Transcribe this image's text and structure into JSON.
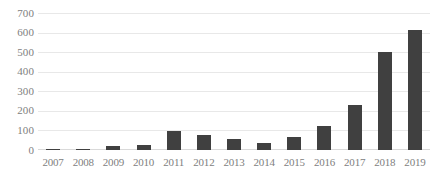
{
  "chart_data": {
    "type": "bar",
    "title": "",
    "subtitle": "",
    "xlabel": "",
    "ylabel": "",
    "categories": [
      "2007",
      "2008",
      "2009",
      "2010",
      "2011",
      "2012",
      "2013",
      "2014",
      "2015",
      "2016",
      "2017",
      "2018",
      "2019"
    ],
    "values": [
      4,
      5,
      18,
      25,
      98,
      75,
      55,
      38,
      65,
      125,
      230,
      500,
      615
    ],
    "ylim": [
      0,
      700
    ],
    "ytick_labels": [
      "700",
      "600",
      "500",
      "400",
      "300",
      "200",
      "100",
      "0"
    ],
    "ytick_values": [
      700,
      600,
      500,
      400,
      300,
      200,
      100,
      0
    ],
    "grid": true,
    "legend": false,
    "series": [
      {
        "name": "",
        "values": [
          4,
          5,
          18,
          25,
          98,
          75,
          55,
          38,
          65,
          125,
          230,
          500,
          615
        ]
      }
    ],
    "colors": {
      "bar": "#404040",
      "grid": "#e8e8e8",
      "axis": "#d9d9d9",
      "tick_text": "#808080",
      "background": "#ffffff"
    }
  }
}
